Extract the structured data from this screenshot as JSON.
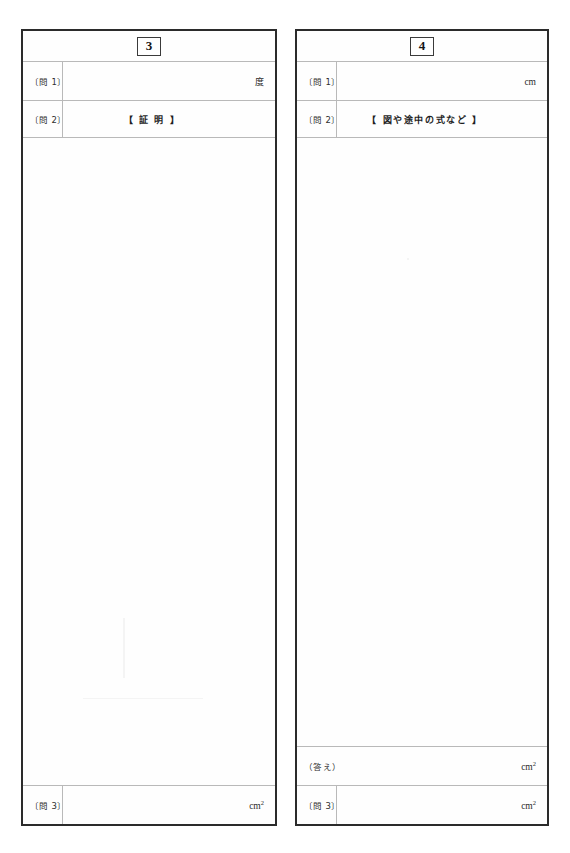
{
  "document": {
    "kind": "answer-sheet",
    "background_color": "#ffffff",
    "ink_color": "#2b2b2b",
    "rule_color": "#b9b9b9",
    "border_color": "#2b2b2b"
  },
  "panels": [
    {
      "problem_number": "3",
      "rows": [
        {
          "label": "〔問 1〕",
          "unit": "度",
          "unit_style": "jp"
        },
        {
          "label": "〔問 2〕",
          "caption": "【  証  明  】"
        }
      ],
      "footer_rows": [
        {
          "label": "〔問 3〕",
          "unit": "cm",
          "unit_sup": "2"
        }
      ]
    },
    {
      "problem_number": "4",
      "rows": [
        {
          "label": "〔問 1〕",
          "unit": "cm",
          "unit_sup": ""
        },
        {
          "label": "〔問 2〕",
          "caption": "【  図や途中の式など  】"
        }
      ],
      "footer_rows": [
        {
          "label": "（答え）",
          "unit": "cm",
          "unit_sup": "2"
        },
        {
          "label": "〔問 3〕",
          "unit": "cm",
          "unit_sup": "2"
        }
      ]
    }
  ]
}
